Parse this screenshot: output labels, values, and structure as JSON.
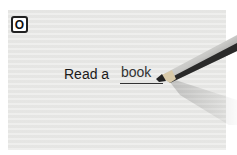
{
  "exercise": {
    "label": "O",
    "prompt": "Read a",
    "answer": "book"
  },
  "icons": {
    "pencil": "pencil-icon"
  },
  "colors": {
    "card_background": "#e9e9e7",
    "text": "#1a1a1a"
  }
}
